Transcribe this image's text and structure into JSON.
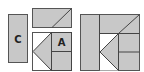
{
  "diagram": {
    "colors": {
      "fill": "#c8c8c8",
      "stroke": "#444444",
      "background": "#ffffff"
    },
    "pieces": {
      "c_label": "C",
      "a_label": "A"
    }
  }
}
